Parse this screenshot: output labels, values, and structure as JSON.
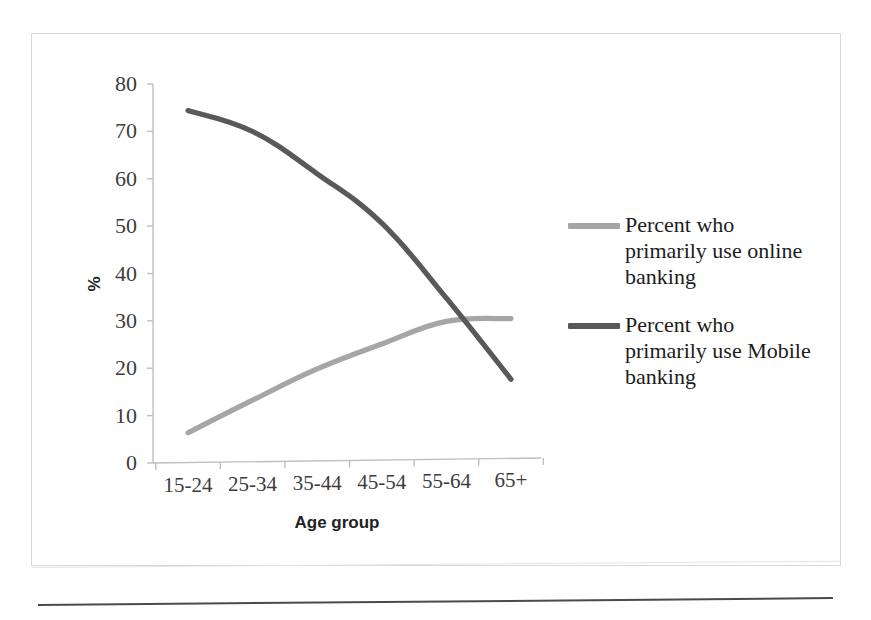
{
  "chart_data": {
    "type": "line",
    "title": "",
    "subtitle": "",
    "xlabel": "Age group",
    "ylabel": "%",
    "categories": [
      "15-24",
      "25-34",
      "35-44",
      "45-54",
      "55-64",
      "65+"
    ],
    "ylim": [
      0,
      80
    ],
    "ytick_labels": [
      "80",
      "70",
      "60",
      "50",
      "40",
      "30",
      "20",
      "10",
      "0"
    ],
    "ytick_values": [
      80,
      70,
      60,
      50,
      40,
      30,
      20,
      10,
      0
    ],
    "grid": false,
    "legend_position": "right",
    "series": [
      {
        "name": "Percent who primarily use online banking",
        "color": "#a6a6a6",
        "values": [
          6.3,
          13.0,
          19.4,
          24.5,
          29.1,
          29.5
        ]
      },
      {
        "name": "Percent who primarily use Mobile banking",
        "color": "#595959",
        "values": [
          74.3,
          69.7,
          60.6,
          50.0,
          34.0,
          16.7
        ]
      }
    ]
  },
  "axes": {
    "y_title": "%",
    "x_title": "Age group"
  },
  "legend": {
    "items": [
      {
        "label": "Percent who primarily use online banking",
        "color": "#a6a6a6"
      },
      {
        "label": "Percent who primarily use Mobile banking",
        "color": "#595959"
      }
    ]
  },
  "colors": {
    "online_banking": "#a6a6a6",
    "mobile_banking": "#595959",
    "axis": "#bfbfbf",
    "frame": "#d9d9d9",
    "text": "#3c3c3c"
  }
}
